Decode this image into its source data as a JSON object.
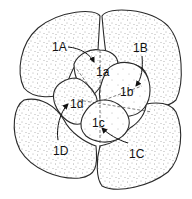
{
  "diagram": {
    "type": "embryo-8-cell-spiral-cleavage",
    "macromeres": [
      {
        "id": "1A",
        "label": "1A"
      },
      {
        "id": "1B",
        "label": "1B"
      },
      {
        "id": "1C",
        "label": "1C"
      },
      {
        "id": "1D",
        "label": "1D"
      }
    ],
    "micromeres": [
      {
        "id": "1a",
        "label": "1a"
      },
      {
        "id": "1b",
        "label": "1b"
      },
      {
        "id": "1c",
        "label": "1c"
      },
      {
        "id": "1d",
        "label": "1d"
      }
    ],
    "colors": {
      "outline": "#2a2a2a",
      "stipple": "#555555",
      "background": "#ffffff"
    }
  }
}
